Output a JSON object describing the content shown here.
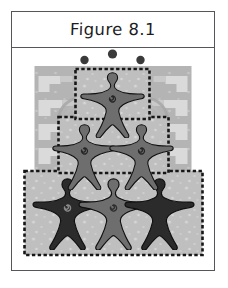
{
  "figure": {
    "title": "Figure 8.1",
    "caption_label": "Figure 8.1"
  },
  "colors": {
    "frame_border": "#55565a",
    "title_text": "#1d1d1f",
    "page_background": "#ffffff",
    "backdrop_gray": "#b4b4b4",
    "backdrop_step_light": "#d6d6d6",
    "backdrop_step_lighter": "#e4e4e4",
    "panel_fill": "#bfbfbf",
    "panel_border": "#161616",
    "speckle": "#d4d4d4",
    "figure_light": "#8e8e8e",
    "figure_mid": "#6e6e6e",
    "figure_dark": "#2b2b2b",
    "figure_outline": "#141414",
    "dot_fill": "#3a3a3a"
  },
  "illustration": {
    "name": "human-pyramid-star-figures",
    "description": "Stacked pyramid of five-pointed human star figures over a stepped pueblo-pattern backdrop",
    "tiers": [
      {
        "tier": 1,
        "position": "top",
        "figure_count": 1,
        "figures": [
          {
            "id": "top-center",
            "shade": "mid",
            "torso_mark": "spiral"
          }
        ]
      },
      {
        "tier": 2,
        "position": "middle",
        "figure_count": 2,
        "figures": [
          {
            "id": "middle-left",
            "shade": "mid",
            "torso_mark": "spiral"
          },
          {
            "id": "middle-right",
            "shade": "mid",
            "torso_mark": "spiral"
          }
        ]
      },
      {
        "tier": 3,
        "position": "bottom",
        "figure_count": 3,
        "figures": [
          {
            "id": "bottom-left",
            "shade": "dark",
            "torso_mark": "spiral"
          },
          {
            "id": "bottom-center",
            "shade": "mid",
            "torso_mark": "spiral"
          },
          {
            "id": "bottom-right",
            "shade": "dark",
            "torso_mark": "none"
          }
        ]
      }
    ],
    "total_figures": 6,
    "dots_above_count": 3,
    "panel_count": 3,
    "panel_border_style": "dashed",
    "backdrop_motif": "stepped-terrace"
  }
}
